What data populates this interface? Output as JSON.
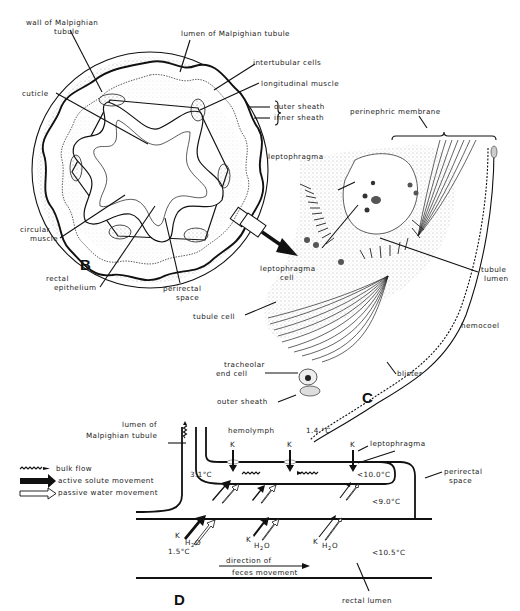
{
  "figure": {
    "panels": {
      "B": {
        "panel_label": "B",
        "labels": {
          "wall_malpighian_1": "wall of Malpighian",
          "wall_malpighian_2": "tubule",
          "lumen_malpighian": "lumen of Malpighian tubule",
          "intertubular_cells": "intertubular cells",
          "longitudinal_muscle": "longitudinal muscle",
          "cuticle": "cuticle",
          "outer_sheath": "outer sheath",
          "inner_sheath": "inner sheath",
          "perinephric_membrane": "perinephric membrane",
          "circular_muscle_1": "circular",
          "circular_muscle_2": "muscle",
          "rectal_epithelium_1": "rectal",
          "rectal_epithelium_2": "epithelium",
          "perirectal_space_1": "perirectal",
          "perirectal_space_2": "space"
        }
      },
      "C": {
        "panel_label": "C",
        "labels": {
          "leptophragma": "leptophragma",
          "leptophragma_cell_1": "leptophragma",
          "leptophragma_cell_2": "cell",
          "tubule_lumen_1": "tubule",
          "tubule_lumen_2": "lumen",
          "tubule_cell": "tubule cell",
          "hemocoel": "hemocoel",
          "tracheolar_end_cell_1": "tracheolar",
          "tracheolar_end_cell_2": "end cell",
          "outer_sheath": "outer sheath",
          "blister": "blister"
        }
      },
      "D": {
        "panel_label": "D",
        "legend": {
          "bulk_flow": "bulk flow",
          "active_solute": "active solute movement",
          "passive_water": "passive water movement"
        },
        "labels": {
          "lumen_malpighian_1": "lumen of",
          "lumen_malpighian_2": "Malpighian tubule",
          "hemolymph": "hemolymph",
          "leptophragma": "leptophragma",
          "perirectal_space_1": "perirectal",
          "perirectal_space_2": "space",
          "direction_1": "direction of",
          "direction_2": "feces movement",
          "rectal_lumen": "rectal lumen",
          "K": "K",
          "H2O_H": "H",
          "H2O_2": "2",
          "H2O_O": "O"
        },
        "temperatures": {
          "hemolymph": "1.4 °C",
          "tubule": "3.1°C",
          "leptophragma_region": "<10.0°C",
          "perirectal": "<9.0°C",
          "rectal_entry": "1.5°C",
          "rectal_lumen": "<10.5°C"
        }
      }
    }
  }
}
